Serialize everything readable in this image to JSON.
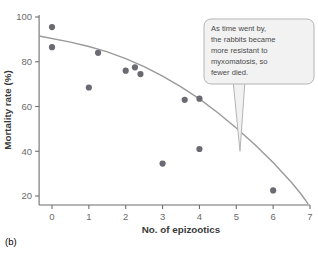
{
  "panel": {
    "label": "(b)"
  },
  "callout": {
    "name": "annotation-callout",
    "lines": [
      "As time went by,",
      "the rabbits became",
      "more resistant to",
      "myxomatosis, so",
      "fewer died."
    ],
    "text": "As time went by, the rabbits became more resistant to myxomatosis, so fewer died.",
    "fill_color": "#f2f2f2",
    "border_color": "#b4b4b4",
    "points_to": {
      "x": 5.1,
      "y": 40
    }
  },
  "colors": {
    "point": "#6a6a72",
    "trendline": "#9a9a9a",
    "axis": "#6e6e6e",
    "tick_label": "#6b6b6b",
    "axis_title": "#3a3a3a"
  },
  "chart_data": {
    "type": "scatter",
    "title": "",
    "xlabel": "No. of epizootics",
    "ylabel": "Mortality rate (%)",
    "xlim": [
      -0.35,
      7.0
    ],
    "ylim": [
      14,
      101
    ],
    "xticks": [
      0,
      1,
      2,
      3,
      4,
      5,
      6,
      7
    ],
    "xticklabels": [
      "0",
      "1",
      "2",
      "3",
      "4",
      "5",
      "6",
      "7"
    ],
    "yticks": [
      20,
      40,
      60,
      80,
      100
    ],
    "yticklabels": [
      "20",
      "40",
      "60",
      "80",
      "100"
    ],
    "grid": false,
    "legend": null,
    "series": [
      {
        "name": "Mortality rate per epizootic",
        "marker": "circle",
        "color": "#6a6a72",
        "points": [
          {
            "x": 0.0,
            "y": 95.5
          },
          {
            "x": 0.0,
            "y": 86.5
          },
          {
            "x": 1.0,
            "y": 68.5
          },
          {
            "x": 1.25,
            "y": 84.0
          },
          {
            "x": 2.0,
            "y": 76.0
          },
          {
            "x": 2.25,
            "y": 77.5
          },
          {
            "x": 2.4,
            "y": 74.5
          },
          {
            "x": 3.0,
            "y": 34.5
          },
          {
            "x": 3.6,
            "y": 63.0
          },
          {
            "x": 4.0,
            "y": 63.5
          },
          {
            "x": 4.0,
            "y": 41.0
          },
          {
            "x": 6.0,
            "y": 22.5
          }
        ]
      }
    ],
    "trendline": {
      "name": "fitted curve",
      "type": "quadratic",
      "color": "#9a9a9a",
      "points": [
        {
          "x": -0.35,
          "y": 91.5
        },
        {
          "x": 0.5,
          "y": 88.8
        },
        {
          "x": 1.0,
          "y": 86.8
        },
        {
          "x": 1.5,
          "y": 84.4
        },
        {
          "x": 2.0,
          "y": 81.4
        },
        {
          "x": 2.5,
          "y": 77.8
        },
        {
          "x": 3.0,
          "y": 73.6
        },
        {
          "x": 3.5,
          "y": 68.8
        },
        {
          "x": 4.0,
          "y": 63.4
        },
        {
          "x": 4.5,
          "y": 57.2
        },
        {
          "x": 5.0,
          "y": 50.4
        },
        {
          "x": 5.5,
          "y": 43.0
        },
        {
          "x": 6.0,
          "y": 35.0
        },
        {
          "x": 6.5,
          "y": 26.0
        },
        {
          "x": 6.75,
          "y": 21.0
        },
        {
          "x": 6.95,
          "y": 16.5
        }
      ]
    }
  }
}
